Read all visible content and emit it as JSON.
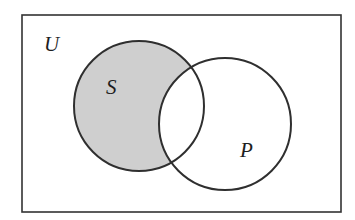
{
  "diagram": {
    "type": "venn",
    "universe": {
      "label": "U",
      "rect": {
        "x": 22,
        "y": 15,
        "width": 319,
        "height": 197
      },
      "label_pos": {
        "x": 44,
        "y": 51
      }
    },
    "sets": [
      {
        "id": "S",
        "label": "S",
        "circle": {
          "cx": 139,
          "cy": 106,
          "r": 65
        },
        "label_pos": {
          "x": 106,
          "y": 94
        }
      },
      {
        "id": "P",
        "label": "P",
        "circle": {
          "cx": 225,
          "cy": 124,
          "r": 66
        },
        "label_pos": {
          "x": 240,
          "y": 157
        }
      }
    ],
    "shaded_region": "S \\ P",
    "colors": {
      "shade": "#cfcfcf",
      "stroke": "#2f2f2f",
      "background": "#ffffff",
      "text": "#1e1e1e"
    }
  }
}
